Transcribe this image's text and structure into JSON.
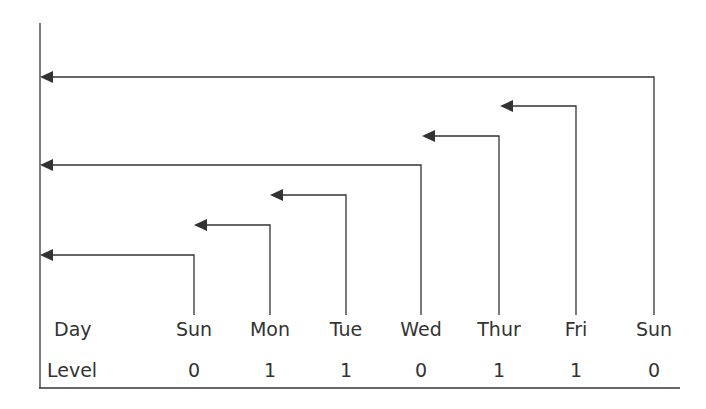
{
  "diagram": {
    "row_labels": {
      "day": "Day",
      "level": "Level"
    },
    "columns": [
      {
        "day": "Sun",
        "level": "0",
        "x": 194
      },
      {
        "day": "Mon",
        "level": "1",
        "x": 270
      },
      {
        "day": "Tue",
        "level": "1",
        "x": 346
      },
      {
        "day": "Wed",
        "level": "0",
        "x": 421
      },
      {
        "day": "Thur",
        "level": "1",
        "x": 499
      },
      {
        "day": "Fri",
        "level": "1",
        "x": 576
      },
      {
        "day": "Sun",
        "level": "0",
        "x": 654
      }
    ],
    "arrows": [
      {
        "from_col": 0,
        "y": 255,
        "to_x": 40
      },
      {
        "from_col": 1,
        "y": 225,
        "to_x": 194
      },
      {
        "from_col": 2,
        "y": 195,
        "to_x": 270
      },
      {
        "from_col": 3,
        "y": 165,
        "to_x": 40
      },
      {
        "from_col": 4,
        "y": 136,
        "to_x": 422
      },
      {
        "from_col": 5,
        "y": 106,
        "to_x": 500
      },
      {
        "from_col": 6,
        "y": 77,
        "to_x": 40
      }
    ],
    "line_color": "#333333"
  }
}
